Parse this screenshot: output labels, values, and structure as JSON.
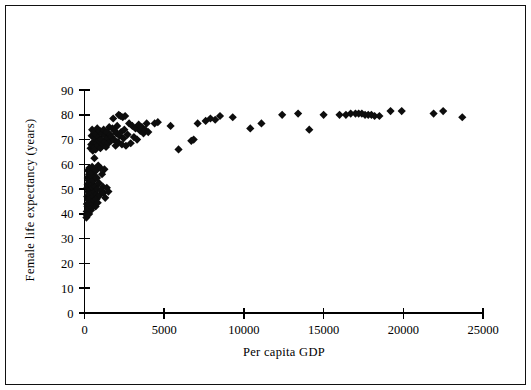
{
  "chart_data": {
    "type": "scatter",
    "title": "",
    "xlabel": "Per capita GDP",
    "ylabel": "Female life expectancy (years)",
    "xlim": [
      0,
      25000
    ],
    "ylim": [
      0,
      90
    ],
    "xticks": [
      0,
      5000,
      10000,
      15000,
      20000,
      25000
    ],
    "yticks": [
      0,
      10,
      20,
      30,
      40,
      50,
      60,
      70,
      80,
      90
    ],
    "xtick_labels": [
      "0",
      "5000",
      "10000",
      "15000",
      "20000",
      "25000"
    ],
    "ytick_labels": [
      "0",
      "10",
      "20",
      "30",
      "40",
      "50",
      "60",
      "70",
      "80",
      "90"
    ],
    "grid": false,
    "legend": false,
    "marker_shape": "diamond",
    "marker_color": "#0d0d0d",
    "marker_size": 7,
    "series": [
      {
        "name": "Countries",
        "points": [
          [
            120,
            38.5
          ],
          [
            140,
            41.0
          ],
          [
            150,
            44.0
          ],
          [
            160,
            39.5
          ],
          [
            170,
            47.0
          ],
          [
            180,
            50.5
          ],
          [
            190,
            43.0
          ],
          [
            200,
            52.0
          ],
          [
            205,
            54.5
          ],
          [
            210,
            46.0
          ],
          [
            215,
            57.5
          ],
          [
            220,
            49.0
          ],
          [
            230,
            42.0
          ],
          [
            240,
            55.0
          ],
          [
            250,
            51.0
          ],
          [
            255,
            53.5
          ],
          [
            260,
            45.5
          ],
          [
            270,
            48.0
          ],
          [
            280,
            56.0
          ],
          [
            290,
            40.0
          ],
          [
            300,
            58.5
          ],
          [
            310,
            44.5
          ],
          [
            320,
            52.5
          ],
          [
            330,
            50.0
          ],
          [
            340,
            47.5
          ],
          [
            350,
            54.0
          ],
          [
            360,
            43.5
          ],
          [
            370,
            57.0
          ],
          [
            380,
            49.5
          ],
          [
            390,
            46.5
          ],
          [
            400,
            53.0
          ],
          [
            410,
            41.5
          ],
          [
            420,
            55.5
          ],
          [
            430,
            51.5
          ],
          [
            440,
            48.5
          ],
          [
            450,
            45.0
          ],
          [
            460,
            56.5
          ],
          [
            470,
            42.5
          ],
          [
            480,
            59.0
          ],
          [
            490,
            52.0
          ],
          [
            500,
            44.0
          ],
          [
            520,
            50.5
          ],
          [
            540,
            47.0
          ],
          [
            560,
            53.5
          ],
          [
            580,
            58.0
          ],
          [
            600,
            45.5
          ],
          [
            620,
            62.5
          ],
          [
            640,
            49.0
          ],
          [
            660,
            55.0
          ],
          [
            680,
            51.0
          ],
          [
            700,
            43.0
          ],
          [
            720,
            57.5
          ],
          [
            740,
            48.0
          ],
          [
            760,
            46.0
          ],
          [
            780,
            54.5
          ],
          [
            800,
            50.0
          ],
          [
            830,
            44.5
          ],
          [
            860,
            59.5
          ],
          [
            900,
            52.5
          ],
          [
            950,
            47.5
          ],
          [
            1000,
            58.5
          ],
          [
            1050,
            49.5
          ],
          [
            1100,
            56.0
          ],
          [
            1150,
            51.0
          ],
          [
            1200,
            48.5
          ],
          [
            1250,
            58.0
          ],
          [
            1300,
            46.5
          ],
          [
            1400,
            50.5
          ],
          [
            1500,
            49.0
          ],
          [
            380,
            66.5
          ],
          [
            420,
            68.0
          ],
          [
            450,
            71.5
          ],
          [
            480,
            74.0
          ],
          [
            520,
            65.5
          ],
          [
            560,
            69.0
          ],
          [
            600,
            73.0
          ],
          [
            640,
            67.0
          ],
          [
            680,
            70.5
          ],
          [
            700,
            66.0
          ],
          [
            730,
            72.0
          ],
          [
            760,
            68.5
          ],
          [
            800,
            74.5
          ],
          [
            840,
            67.5
          ],
          [
            880,
            71.0
          ],
          [
            920,
            69.5
          ],
          [
            960,
            73.5
          ],
          [
            1000,
            66.5
          ],
          [
            1050,
            70.0
          ],
          [
            1100,
            72.5
          ],
          [
            1150,
            68.0
          ],
          [
            1200,
            74.0
          ],
          [
            1250,
            69.0
          ],
          [
            1300,
            71.5
          ],
          [
            1350,
            67.0
          ],
          [
            1400,
            73.0
          ],
          [
            1450,
            70.5
          ],
          [
            1500,
            68.5
          ],
          [
            1550,
            75.0
          ],
          [
            1600,
            72.0
          ],
          [
            1650,
            69.5
          ],
          [
            1700,
            71.0
          ],
          [
            1750,
            74.5
          ],
          [
            1800,
            78.5
          ],
          [
            1850,
            70.0
          ],
          [
            1900,
            73.5
          ],
          [
            1950,
            67.5
          ],
          [
            2000,
            72.5
          ],
          [
            2050,
            75.5
          ],
          [
            2100,
            69.0
          ],
          [
            2150,
            80.0
          ],
          [
            2200,
            71.5
          ],
          [
            2250,
            79.5
          ],
          [
            2300,
            73.0
          ],
          [
            2350,
            68.0
          ],
          [
            2400,
            79.0
          ],
          [
            2450,
            70.5
          ],
          [
            2500,
            74.0
          ],
          [
            2550,
            79.5
          ],
          [
            2600,
            67.5
          ],
          [
            2700,
            72.0
          ],
          [
            2800,
            76.5
          ],
          [
            2900,
            68.5
          ],
          [
            3000,
            75.5
          ],
          [
            3100,
            71.0
          ],
          [
            3200,
            74.5
          ],
          [
            3300,
            70.0
          ],
          [
            3400,
            76.0
          ],
          [
            3500,
            73.5
          ],
          [
            3600,
            75.0
          ],
          [
            3700,
            72.5
          ],
          [
            3800,
            74.0
          ],
          [
            3900,
            76.5
          ],
          [
            4000,
            73.0
          ],
          [
            4400,
            76.5
          ],
          [
            4600,
            77.0
          ],
          [
            5400,
            75.5
          ],
          [
            5900,
            66.0
          ],
          [
            6700,
            69.5
          ],
          [
            6850,
            70.0
          ],
          [
            7100,
            76.5
          ],
          [
            7600,
            77.5
          ],
          [
            7900,
            78.5
          ],
          [
            8200,
            78.0
          ],
          [
            8500,
            79.5
          ],
          [
            9300,
            79.0
          ],
          [
            10400,
            74.5
          ],
          [
            11100,
            76.5
          ],
          [
            12400,
            80.0
          ],
          [
            13400,
            80.5
          ],
          [
            14100,
            74.0
          ],
          [
            15000,
            80.0
          ],
          [
            16000,
            80.0
          ],
          [
            16400,
            80.0
          ],
          [
            16700,
            80.5
          ],
          [
            17000,
            80.5
          ],
          [
            17200,
            80.5
          ],
          [
            17400,
            80.5
          ],
          [
            17600,
            80.0
          ],
          [
            17800,
            80.0
          ],
          [
            18000,
            80.0
          ],
          [
            18200,
            79.5
          ],
          [
            18500,
            79.5
          ],
          [
            19200,
            81.5
          ],
          [
            19900,
            81.5
          ],
          [
            21900,
            80.5
          ],
          [
            22500,
            81.5
          ],
          [
            23700,
            79.0
          ]
        ]
      }
    ]
  },
  "figure": {
    "axis_color": "#000000",
    "background": "#ffffff",
    "frame_border_color": "#111111"
  }
}
